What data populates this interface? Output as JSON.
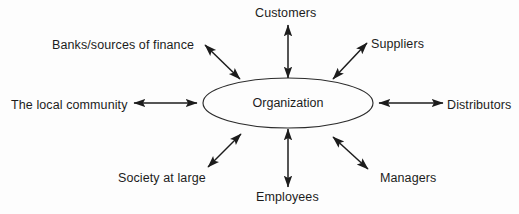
{
  "diagram": {
    "type": "stakeholder-map",
    "center": {
      "label": "Organization",
      "shape": "ellipse"
    },
    "colors": {
      "background": "#fdfdfd",
      "stroke": "#1c1c1c",
      "text": "#1c1c1c"
    },
    "nodes": [
      {
        "id": "customers",
        "label": "Customers",
        "position": "top"
      },
      {
        "id": "suppliers",
        "label": "Suppliers",
        "position": "top-right"
      },
      {
        "id": "distributors",
        "label": "Distributors",
        "position": "right"
      },
      {
        "id": "managers",
        "label": "Managers",
        "position": "bottom-right"
      },
      {
        "id": "employees",
        "label": "Employees",
        "position": "bottom"
      },
      {
        "id": "society",
        "label": "Society at large",
        "position": "bottom-left"
      },
      {
        "id": "local-community",
        "label": "The local community",
        "position": "left"
      },
      {
        "id": "banks",
        "label": "Banks/sources of finance",
        "position": "top-left"
      }
    ],
    "connectors": [
      {
        "id": "connector-customers",
        "from": "Organization",
        "to": "Customers",
        "style": "double-arrow"
      },
      {
        "id": "connector-suppliers",
        "from": "Organization",
        "to": "Suppliers",
        "style": "double-arrow"
      },
      {
        "id": "connector-distributors",
        "from": "Organization",
        "to": "Distributors",
        "style": "double-arrow"
      },
      {
        "id": "connector-managers",
        "from": "Organization",
        "to": "Managers",
        "style": "double-arrow"
      },
      {
        "id": "connector-employees",
        "from": "Organization",
        "to": "Employees",
        "style": "double-arrow"
      },
      {
        "id": "connector-society",
        "from": "Organization",
        "to": "Society at large",
        "style": "double-arrow"
      },
      {
        "id": "connector-local-community",
        "from": "Organization",
        "to": "The local community",
        "style": "double-arrow"
      },
      {
        "id": "connector-banks",
        "from": "Organization",
        "to": "Banks/sources of finance",
        "style": "double-arrow"
      }
    ]
  }
}
